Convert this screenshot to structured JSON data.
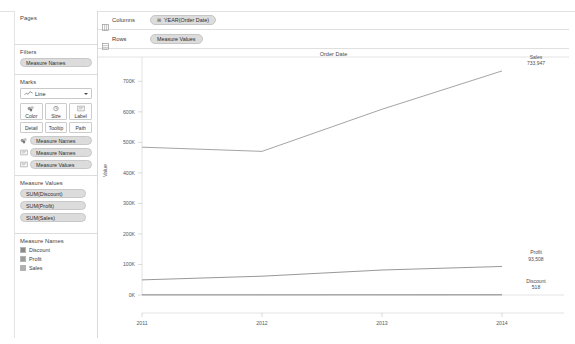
{
  "sidebar": {
    "pages": {
      "title": "Pages",
      "items": []
    },
    "filters": {
      "title": "Filters",
      "items": [
        {
          "label": "Measure Names"
        }
      ]
    },
    "marks": {
      "title": "Marks",
      "mark_type": "Line",
      "mark_type_icon": "line-chart-icon",
      "property_buttons": [
        {
          "label": "Color",
          "icon": "color-palette-icon"
        },
        {
          "label": "Size",
          "icon": "size-circle-icon"
        },
        {
          "label": "Label",
          "icon": "label-text-icon"
        }
      ],
      "flat_buttons": [
        {
          "label": "Detail",
          "icon": "detail-icon"
        },
        {
          "label": "Tooltip",
          "icon": "tooltip-icon"
        },
        {
          "label": "Path",
          "icon": "path-icon"
        }
      ],
      "applied": [
        {
          "label": "Measure Names",
          "icon": "color-palette-icon"
        },
        {
          "label": "Measure Names",
          "icon": "label-text-icon"
        },
        {
          "label": "Measure Values",
          "icon": "label-text-icon"
        }
      ]
    },
    "measure_values": {
      "title": "Measure Values",
      "items": [
        {
          "label": "SUM(Discount)"
        },
        {
          "label": "SUM(Profit)"
        },
        {
          "label": "SUM(Sales)"
        }
      ]
    },
    "measure_names": {
      "title": "Measure Names",
      "items": [
        {
          "label": "Discount",
          "color": "#8a8a8a"
        },
        {
          "label": "Profit",
          "color": "#9d9d9d"
        },
        {
          "label": "Sales",
          "color": "#b0b0b0"
        }
      ]
    }
  },
  "shelves": {
    "columns": {
      "name": "Columns",
      "icon": "columns-grid-icon",
      "pill": {
        "label": "YEAR(Order Date)",
        "expander": "⊞"
      }
    },
    "rows": {
      "name": "Rows",
      "icon": "rows-grid-icon",
      "pill": {
        "label": "Measure Values",
        "expander": ""
      }
    }
  },
  "chart_data": {
    "type": "line",
    "title": "Order Date",
    "xlabel": "",
    "ylabel": "Value",
    "x": [
      "2011",
      "2012",
      "2013",
      "2014"
    ],
    "xtick_labels": [
      "2011",
      "2012",
      "2013",
      "2014"
    ],
    "ytick_labels": [
      "0K",
      "100K",
      "200K",
      "300K",
      "400K",
      "500K",
      "600K",
      "700K"
    ],
    "ytick_values": [
      0,
      100000,
      200000,
      300000,
      400000,
      500000,
      600000,
      700000
    ],
    "ylim": [
      0,
      760000
    ],
    "grid": false,
    "legend_position": "right-annotations",
    "series": [
      {
        "name": "Sales",
        "color": "#9a9a9a",
        "values": [
          484247,
          470533,
          608474,
          733947
        ],
        "end_label_name": "Sales",
        "end_label_value": "733,947"
      },
      {
        "name": "Profit",
        "color": "#8c8c8c",
        "values": [
          49544,
          61619,
          81795,
          93508
        ],
        "end_label_name": "Profit",
        "end_label_value": "93,508"
      },
      {
        "name": "Discount",
        "color": "#777777",
        "values": [
          360,
          410,
          470,
          518
        ],
        "end_label_name": "Discount",
        "end_label_value": "518"
      }
    ]
  }
}
